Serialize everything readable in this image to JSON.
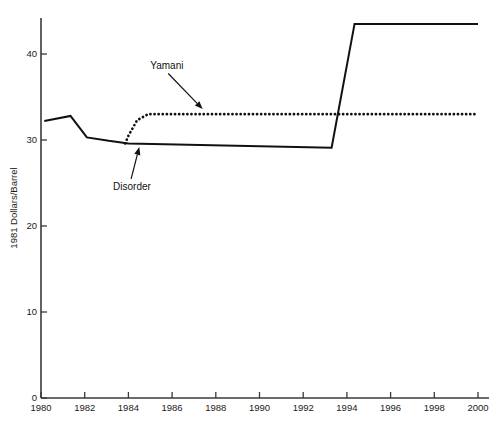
{
  "chart_data": {
    "type": "line",
    "title": "",
    "subtitle": "",
    "xlabel": "",
    "ylabel": "1981 Dollars/Barrel",
    "xlim": [
      1980,
      2000
    ],
    "ylim": [
      0,
      45
    ],
    "grid": false,
    "legend_position": "none (inline annotated labels with arrows)",
    "xticks": [
      "1980",
      "1982",
      "1984",
      "1986",
      "1988",
      "1990",
      "1992",
      "1994",
      "1996",
      "1998",
      "2000"
    ],
    "xtick_values": [
      1980,
      1982,
      1984,
      1986,
      1988,
      1990,
      1992,
      1994,
      1996,
      1998,
      2000
    ],
    "yticks": [
      "0",
      "10",
      "20",
      "30",
      "40"
    ],
    "ytick_values": [
      0,
      10,
      20,
      30,
      40
    ],
    "series": [
      {
        "name": "Disorder",
        "style": "solid",
        "color": "#111111",
        "x": [
          1980.15,
          1981.35,
          1982.1,
          1983.1,
          1984.0,
          1993.3,
          1994.35,
          2000.0
        ],
        "values": [
          32.2,
          32.8,
          30.3,
          29.9,
          29.6,
          29.1,
          43.5,
          43.5
        ]
      },
      {
        "name": "Yamani",
        "style": "dotted",
        "color": "#111111",
        "x": [
          1983.85,
          1984.0,
          1984.4,
          1984.9,
          2000.0
        ],
        "values": [
          29.6,
          30.5,
          32.3,
          33.0,
          33.0
        ]
      }
    ],
    "annotations": [
      {
        "label": "Yamani",
        "text_x": 1985.0,
        "text_y": 38.2,
        "points_to_x": 1987.4,
        "points_to_y": 33.6
      },
      {
        "label": "Disorder",
        "text_x": 1983.3,
        "text_y": 24.2,
        "points_to_x": 1984.5,
        "points_to_y": 29.2
      }
    ]
  }
}
